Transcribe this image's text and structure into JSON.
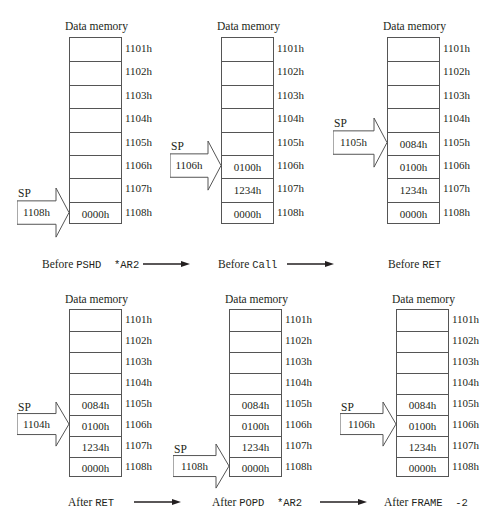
{
  "memory_label": "Data memory",
  "addresses": [
    "1101h",
    "1102h",
    "1103h",
    "1104h",
    "1105h",
    "1106h",
    "1107h",
    "1108h"
  ],
  "sp_label": "SP",
  "panels": [
    {
      "caption_prefix": "Before",
      "caption_code": "PSHD  *AR2",
      "sp_value": "1108h",
      "sp_row": 7,
      "cells": [
        "",
        "",
        "",
        "",
        "",
        "",
        "",
        "0000h"
      ]
    },
    {
      "caption_prefix": "Before",
      "caption_code": "Call",
      "sp_value": "1106h",
      "sp_row": 5,
      "cells": [
        "",
        "",
        "",
        "",
        "",
        "0100h",
        "1234h",
        "0000h"
      ]
    },
    {
      "caption_prefix": "Before",
      "caption_code": "RET",
      "sp_value": "1105h",
      "sp_row": 4,
      "cells": [
        "",
        "",
        "",
        "",
        "0084h",
        "0100h",
        "1234h",
        "0000h"
      ]
    },
    {
      "caption_prefix": "After",
      "caption_code": "RET",
      "sp_value": "1104h",
      "sp_row": 5,
      "cells": [
        "",
        "",
        "",
        "",
        "0084h",
        "0100h",
        "1234h",
        "0000h"
      ]
    },
    {
      "caption_prefix": "After",
      "caption_code": "POPD  *AR2",
      "sp_value": "1108h",
      "sp_row": 7,
      "cells": [
        "",
        "",
        "",
        "",
        "0084h",
        "0100h",
        "1234h",
        "0000h"
      ]
    },
    {
      "caption_prefix": "After",
      "caption_code": "FRAME  -2",
      "sp_value": "1106h",
      "sp_row": 5,
      "cells": [
        "",
        "",
        "",
        "",
        "0084h",
        "0100h",
        "1234h",
        "0000h"
      ]
    }
  ]
}
